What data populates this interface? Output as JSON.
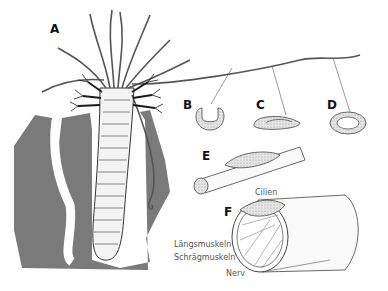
{
  "figure": {
    "panels": [
      {
        "id": "A",
        "label": "A",
        "x": 50,
        "y": 22
      },
      {
        "id": "B",
        "label": "B",
        "x": 183,
        "y": 98
      },
      {
        "id": "C",
        "label": "C",
        "x": 256,
        "y": 98
      },
      {
        "id": "D",
        "label": "D",
        "x": 327,
        "y": 98
      },
      {
        "id": "E",
        "label": "E",
        "x": 202,
        "y": 149
      },
      {
        "id": "F",
        "label": "F",
        "x": 224,
        "y": 205
      }
    ],
    "annotations": [
      {
        "id": "cilien",
        "text": "Cilien",
        "x": 255,
        "y": 188
      },
      {
        "id": "laengsmuskeln",
        "text": "Längsmuskeln",
        "x": 174,
        "y": 240
      },
      {
        "id": "schraegmuskeln",
        "text": "Schrägmuskeln",
        "x": 174,
        "y": 253
      },
      {
        "id": "nerv",
        "text": "Nerv",
        "x": 226,
        "y": 269
      }
    ],
    "colors": {
      "sediment": "#7a7a7a",
      "line": "#3a3a3a",
      "stipple": "#c8c8c8",
      "gills": "#1a1a1a",
      "label": "#111111",
      "annotation": "#555555"
    }
  }
}
